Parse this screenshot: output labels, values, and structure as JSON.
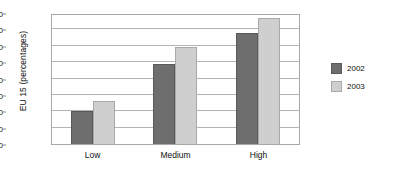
{
  "chart_data": {
    "type": "bar",
    "title": "",
    "subtitle": "",
    "xlabel": "",
    "ylabel": "EU 15 (percentages)",
    "categories": [
      "Low",
      "Medium",
      "High"
    ],
    "series": [
      {
        "name": "2002",
        "color": "#6e6e6e",
        "values": [
          20,
          49,
          68
        ]
      },
      {
        "name": "2003",
        "color": "#cfcfcf",
        "values": [
          26,
          59,
          77
        ]
      }
    ],
    "ylim": [
      0,
      80
    ],
    "ytick_step": 10,
    "yticks": [
      0,
      10,
      20,
      30,
      40,
      50,
      60,
      70,
      80
    ],
    "ytick_labels": [
      "0",
      "10",
      "20",
      "30",
      "40",
      "50",
      "60",
      "70",
      "80"
    ],
    "grid": "horizontal",
    "legend_position": "right",
    "legend": [
      "2002",
      "2003"
    ]
  }
}
